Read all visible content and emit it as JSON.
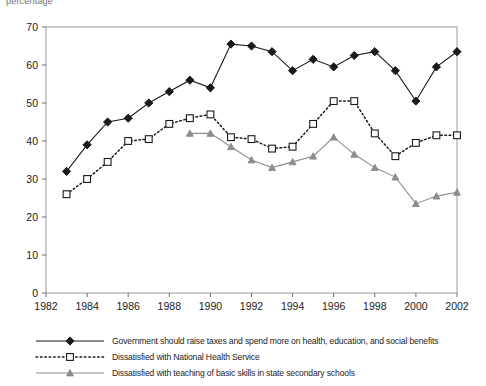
{
  "figure": {
    "top_caption": "percentage"
  },
  "axes": {
    "y_ticks": [
      0,
      10,
      20,
      30,
      40,
      50,
      60,
      70
    ],
    "x_ticks": [
      1982,
      1984,
      1986,
      1988,
      1990,
      1992,
      1994,
      1996,
      1998,
      2000,
      2002
    ],
    "y_min": 0,
    "y_max": 70,
    "x_min": 1982,
    "x_max": 2002,
    "frame_color": "#9a9a9a"
  },
  "legend": {
    "items": [
      {
        "label": "Government should raise taxes and spend more on health, education, and social benefits",
        "marker": "diamond-marker",
        "style": "solid",
        "color": "#1a1a1a"
      },
      {
        "label": "Dissatisfied with National Health Service",
        "marker": "square-marker",
        "style": "dotted",
        "color": "#1a1a1a"
      },
      {
        "label": "Dissatisfied with teaching of basic skills in state secondary schools",
        "marker": "triangle-marker",
        "style": "solid",
        "color": "#8d8d8d"
      }
    ]
  },
  "chart_data": {
    "type": "line",
    "title": "",
    "subtitle": "",
    "xlabel": "",
    "ylabel": "percentage",
    "xlim": [
      1982,
      2002
    ],
    "ylim": [
      0,
      70
    ],
    "ytick_step": 10,
    "xtick_step": 2,
    "grid": false,
    "legend_position": "bottom",
    "series": [
      {
        "name": "Government should raise taxes and spend more on health, education, and social benefits",
        "marker": "diamond",
        "linestyle": "solid",
        "color": "#1a1a1a",
        "x": [
          1983,
          1984,
          1985,
          1986,
          1987,
          1988,
          1989,
          1990,
          1991,
          1992,
          1993,
          1994,
          1995,
          1996,
          1997,
          1998,
          1999,
          2000,
          2001,
          2002
        ],
        "values": [
          32,
          39,
          45,
          46,
          50,
          53,
          56,
          54,
          65.5,
          65,
          63.5,
          58.5,
          61.5,
          59.5,
          62.5,
          63.5,
          58.5,
          50.5,
          59.5,
          63.5
        ]
      },
      {
        "name": "Dissatisfied with National Health Service",
        "marker": "square",
        "linestyle": "dotted",
        "color": "#1a1a1a",
        "x": [
          1983,
          1984,
          1985,
          1986,
          1987,
          1988,
          1989,
          1990,
          1991,
          1992,
          1993,
          1994,
          1995,
          1996,
          1997,
          1998,
          1999,
          2000,
          2001,
          2002
        ],
        "values": [
          26,
          30,
          34.5,
          40,
          40.5,
          44.5,
          46,
          47,
          41,
          40.5,
          38,
          38.5,
          44.5,
          50.5,
          50.5,
          42,
          36,
          39.5,
          41.5,
          41.5
        ]
      },
      {
        "name": "Dissatisfied with teaching of basic skills in state secondary schools",
        "marker": "triangle",
        "linestyle": "solid",
        "color": "#8d8d8d",
        "x": [
          1989,
          1990,
          1991,
          1992,
          1993,
          1994,
          1995,
          1996,
          1997,
          1998,
          1999,
          2000,
          2001,
          2002
        ],
        "values": [
          42,
          42,
          38.5,
          35,
          33,
          34.5,
          36,
          41,
          36.5,
          33,
          30.5,
          23.5,
          25.5,
          26.5
        ]
      }
    ]
  }
}
